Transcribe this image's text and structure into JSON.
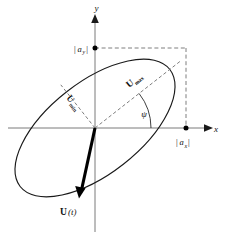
{
  "figure": {
    "name": "polarization-ellipse-diagram",
    "background_color": "#ffffff",
    "line_color": "#1a1a1a",
    "dash_color": "#6f6f6f",
    "axis_color": "#7a7a7a",
    "vector_color": "#000000"
  },
  "axes": {
    "x_label": "x",
    "y_label": "y",
    "origin_label": "",
    "x_axis_name": "horizontal-axis",
    "y_axis_name": "vertical-axis"
  },
  "labels": {
    "amplitude_x": {
      "bar_open": "|",
      "symbol": "a",
      "subscript": "x",
      "bar_close": "|",
      "full": "|a_x|"
    },
    "amplitude_y": {
      "bar_open": "|",
      "symbol": "a",
      "subscript": "y",
      "bar_close": "|",
      "full": "|a_y|"
    },
    "u_max": {
      "symbol": "U",
      "subscript": "max",
      "full": "U_max"
    },
    "u_min": {
      "symbol": "U",
      "subscript": "min",
      "full": "U_min"
    },
    "angle": {
      "symbol": "ψ",
      "name": "psi",
      "full": "ψ"
    },
    "field_vector": {
      "symbol": "U",
      "argument": "(t)",
      "full": "U(t)"
    }
  },
  "geometry": {
    "origin": {
      "x": 95,
      "y": 128
    },
    "ellipse": {
      "semi_major": 95,
      "semi_minor": 46,
      "rotation_deg": -38,
      "center": {
        "x": 95,
        "y": 128
      }
    },
    "bounding_box": {
      "x_extent": 186,
      "y_extent": 48
    },
    "inclination_angle_deg": 38,
    "major_axis_endpoint": {
      "x": 170,
      "y": 69
    },
    "minor_axis_endpoint": {
      "x": 67,
      "y": 92
    },
    "vector_tip": {
      "x": 79,
      "y": 197
    }
  }
}
